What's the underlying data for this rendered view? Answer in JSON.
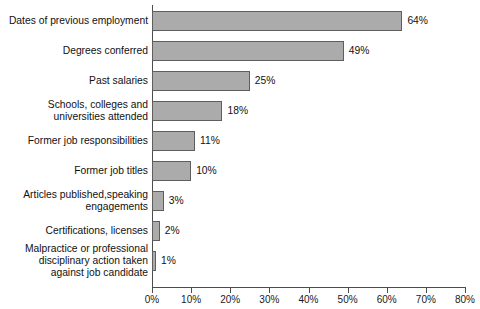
{
  "chart_data": {
    "type": "bar",
    "orientation": "horizontal",
    "title": "",
    "subtitle": "",
    "xlabel": "",
    "ylabel": "",
    "xlim": [
      0,
      80
    ],
    "xtick_step": 10,
    "grid": false,
    "legend": null,
    "bar_color": "#ababab",
    "bar_border_color": "#5e5e5e",
    "axis_color": "#4d4d4d",
    "background": "#ffffff",
    "value_suffix": "%",
    "categories": [
      "Dates of previous employment",
      "Degrees conferred",
      "Past salaries",
      "Schools, colleges and\nuniversities attended",
      "Former job responsibilities",
      "Former job titles",
      "Articles published,speaking\nengagements",
      "Certifications, licenses",
      "Malpractice or professional\ndisciplinary action taken\nagainst job candidate"
    ],
    "values": [
      64,
      49,
      25,
      18,
      11,
      10,
      3,
      2,
      1
    ],
    "value_labels": [
      "64%",
      "49%",
      "25%",
      "18%",
      "11%",
      "10%",
      "3%",
      "2%",
      "1%"
    ],
    "xticks": [
      0,
      10,
      20,
      30,
      40,
      50,
      60,
      70,
      80
    ],
    "xtick_labels": [
      "0%",
      "10%",
      "20%",
      "30%",
      "40%",
      "50%",
      "60%",
      "70%",
      "80%"
    ]
  }
}
